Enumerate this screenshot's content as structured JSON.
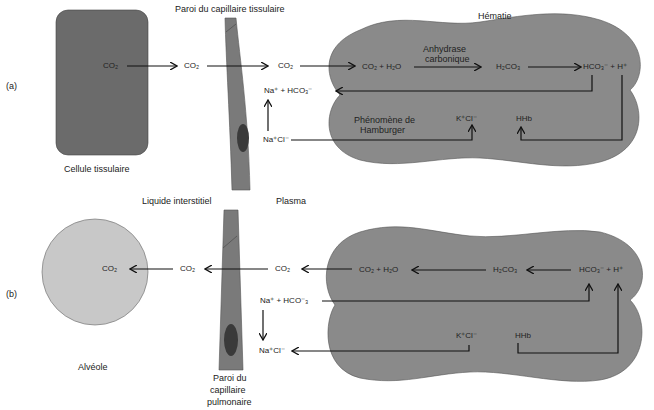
{
  "panel_a": {
    "marker": "(a)",
    "labels": {
      "wall_title": "Paroi du capillaire tissulaire",
      "cell": "Cellule tissulaire",
      "rbc": "Hématie",
      "enzyme_1": "Anhydrase",
      "enzyme_2": "carbonique",
      "hamburger_1": "Phénomène de",
      "hamburger_2": "Hamburger"
    },
    "species": {
      "co2_cell": "CO₂",
      "co2_interstitial": "CO₂",
      "co2_plasma": "CO₂",
      "co2_h2o": "CO₂ + H₂O",
      "h2co3": "H₂CO₃",
      "hco3_h": "HCO₃⁻ + H⁺",
      "na_hco3": "Na⁺ + HCO₃⁻",
      "nacl": "Na⁺Cl⁻",
      "kcl": "K⁺Cl⁻",
      "hhb": "HHb"
    }
  },
  "panel_b": {
    "marker": "(b)",
    "labels": {
      "interstitial": "Liquide interstitiel",
      "plasma": "Plasma",
      "alveolus": "Alvéole",
      "wall_1": "Paroi du",
      "wall_2": "capillaire",
      "wall_3": "pulmonaire"
    },
    "species": {
      "co2_alveolus": "CO₂",
      "co2_interstitial": "CO₂",
      "co2_plasma": "CO₂",
      "co2_h2o": "CO₂ + H₂O",
      "h2co3": "H₂CO₃",
      "hco3_h": "HCO₃⁻ + H⁺",
      "na_hco3": "Na⁺ + HCO⁻₃",
      "nacl": "Na⁺Cl⁻",
      "kcl": "K⁺Cl⁻",
      "hhb": "HHb"
    }
  },
  "colors": {
    "cell": "#6b6b6b",
    "rbc": "#8a8a8a",
    "alveolus": "#c8c8c8",
    "wall": "#7a7a7a",
    "nucleus": "#3a3a3a"
  }
}
